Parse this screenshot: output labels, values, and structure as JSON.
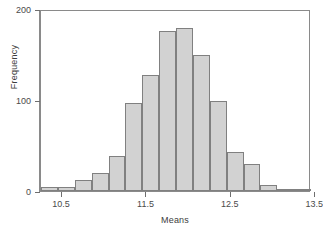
{
  "chart_data": {
    "type": "bar",
    "title": "",
    "subtitle": "",
    "xlabel": "Means",
    "ylabel": "Frequency",
    "xlim": [
      10.25,
      13.45
    ],
    "ylim": [
      0,
      200
    ],
    "grid": false,
    "legend": null,
    "annotations": [],
    "bin_width": 0.2,
    "bin_edges": [
      10.25,
      10.45,
      10.65,
      10.85,
      11.05,
      11.25,
      11.45,
      11.65,
      11.85,
      12.05,
      12.25,
      12.45,
      12.65,
      12.85,
      13.05,
      13.25,
      13.45
    ],
    "categories": [
      "10.25-10.45",
      "10.45-10.65",
      "10.65-10.85",
      "10.85-11.05",
      "11.05-11.25",
      "11.25-11.45",
      "11.45-11.65",
      "11.65-11.85",
      "11.85-12.05",
      "12.05-12.25",
      "12.25-12.45",
      "12.45-12.65",
      "12.65-12.85",
      "12.85-13.05",
      "13.05-13.25",
      "13.25-13.45"
    ],
    "values": [
      4,
      4,
      12,
      20,
      38,
      97,
      127,
      176,
      179,
      150,
      99,
      43,
      30,
      7,
      2,
      0
    ],
    "x_ticks": [
      10.5,
      11.5,
      12.5,
      13.5
    ],
    "x_tick_labels": [
      "10.5",
      "11.5",
      "12.5",
      "13.5"
    ],
    "y_ticks": [
      0,
      100,
      200
    ],
    "y_tick_labels": [
      "0",
      "100",
      "200"
    ],
    "colors": {
      "bar_fill": "#d2d2d2",
      "bar_border": "#808080",
      "axis": "#8a8a8a",
      "text": "#3d3d3d",
      "background": "#ffffff"
    }
  }
}
